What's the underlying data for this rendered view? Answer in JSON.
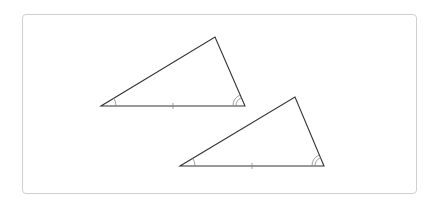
{
  "diagram": {
    "stroke_color": "#333333",
    "mark_color": "#888888",
    "frame_color": "#cfcfcf",
    "triangles": [
      {
        "id": "triangle-1",
        "vertices": [
          [
            101,
            106
          ],
          [
            245,
            106
          ],
          [
            215,
            37
          ]
        ],
        "single_arc_vertex": 0,
        "double_arc_vertex": 1,
        "tick_side": [
          0,
          1
        ]
      },
      {
        "id": "triangle-2",
        "vertices": [
          [
            180,
            166
          ],
          [
            324,
            166
          ],
          [
            295,
            97
          ]
        ],
        "single_arc_vertex": 0,
        "double_arc_vertex": 1,
        "tick_side": [
          0,
          1
        ]
      }
    ]
  }
}
